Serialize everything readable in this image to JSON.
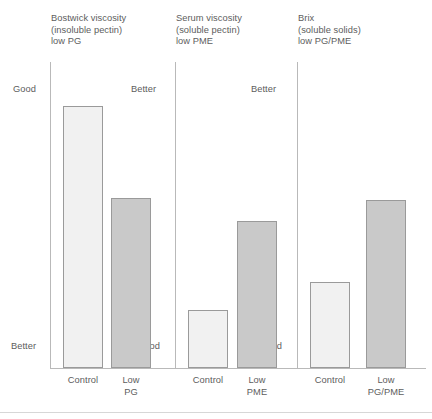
{
  "chart_data": {
    "type": "bar",
    "title": "",
    "subtitle": "",
    "xlabel": "",
    "ylabel": "",
    "grid": false,
    "legend_position": "none",
    "axis_annotations": {
      "y_top_left": "Good",
      "y_bottom_left": "Better",
      "group1_top_right": "Better",
      "group1_bottom_right": "Good",
      "group2_top_right": "Better",
      "group2_bottom_right": "Good"
    },
    "groups": [
      {
        "title": "Bostwick viscosity\n(insoluble pectin)\nlow PG",
        "title_line1": "Bostwick viscosity",
        "title_line2": "(insoluble pectin)",
        "title_line3": "low PG",
        "categories": [
          "Control",
          "Low\nPG"
        ],
        "values": [
          100,
          65
        ],
        "bar_styles": [
          "light",
          "dark"
        ]
      },
      {
        "title": "Serum viscosity\n(soluble pectin)\nlow PME",
        "title_line1": "Serum viscosity",
        "title_line2": "(soluble pectin)",
        "title_line3": "low PME",
        "categories": [
          "Control",
          "Low\nPME"
        ],
        "values": [
          22,
          56
        ],
        "bar_styles": [
          "light",
          "dark"
        ]
      },
      {
        "title": "Brix\n(soluble solids)\nlow PG/PME",
        "title_line1": "Brix",
        "title_line2": "(soluble solids)",
        "title_line3": "low PG/PME",
        "categories": [
          "Control",
          "Low\nPG/PME"
        ],
        "values": [
          33,
          64
        ],
        "bar_styles": [
          "light",
          "dark"
        ]
      }
    ],
    "ylim": [
      0,
      100
    ],
    "colors": {
      "light_bar_fill": "#f1f1f1",
      "dark_bar_fill": "#c9c9c9",
      "bar_border": "#9a9a9a",
      "axis_line": "#b9b9b9",
      "text": "#5d5d5d"
    }
  },
  "groups": {
    "g1": {
      "title": "Bostwick viscosity\n(insoluble pectin)\nlow PG",
      "cat1": "Control",
      "cat2": "Low\nPG"
    },
    "g2": {
      "title": "Serum viscosity\n(soluble pectin)\nlow PME",
      "cat1": "Control",
      "cat2": "Low\nPME"
    },
    "g3": {
      "title": "Brix\n(soluble solids)\nlow PG/PME",
      "cat1": "Control",
      "cat2": "Low\nPG/PME"
    }
  },
  "annotations": {
    "good_left": "Good",
    "better_left": "Better",
    "better_1": "Better",
    "good_1": "Good",
    "better_2": "Better",
    "good_2": "Good"
  }
}
